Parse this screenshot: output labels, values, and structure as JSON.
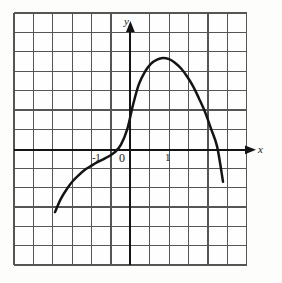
{
  "figure": {
    "name": "graph-of-function-on-grid",
    "background_color": "#fdfdfc",
    "grid_color": "#5a5a5a",
    "axis_color": "#1a1a1a",
    "curve_color": "#141414"
  },
  "labels": {
    "y_axis": "y",
    "x_axis": "x",
    "tick_neg_one": "-1",
    "tick_zero": "0",
    "tick_one": "1"
  },
  "chart_data": {
    "type": "line",
    "title": "",
    "xlabel": "x",
    "ylabel": "y",
    "grid": true,
    "grid_columns": 12,
    "grid_rows": 13,
    "grid_cell_px": 19.4,
    "legend": null,
    "axes": {
      "origin_px": [
        133,
        150
      ],
      "unit_px": 38.8,
      "xlim": [
        -3.07,
        2.94
      ],
      "ylim": [
        -2.89,
        3.53
      ],
      "x_ticks": [
        -1,
        0,
        1
      ],
      "y_ticks": []
    },
    "x": [
      -2.01,
      -1.86,
      -1.7,
      -1.55,
      -1.39,
      -1.24,
      -1.08,
      -0.93,
      -0.77,
      -0.62,
      -0.46,
      -0.31,
      -0.15,
      0.0,
      0.15,
      0.31,
      0.46,
      0.62,
      0.77,
      0.93,
      1.08,
      1.24,
      1.39,
      1.55,
      1.7,
      1.86,
      2.01,
      2.17,
      2.32
    ],
    "y": [
      -1.6,
      -1.26,
      -1.0,
      -0.8,
      -0.64,
      -0.51,
      -0.41,
      -0.32,
      -0.24,
      -0.16,
      -0.05,
      0.14,
      0.53,
      1.16,
      1.69,
      2.02,
      2.22,
      2.33,
      2.37,
      2.34,
      2.25,
      2.1,
      1.9,
      1.64,
      1.33,
      0.97,
      0.55,
      0.08,
      -0.82
    ],
    "annotations": [
      {
        "name": "left-endpoint",
        "x": -2.01,
        "y": -1.6
      },
      {
        "name": "inflection-plateau",
        "x": -1.0,
        "y": -0.13
      },
      {
        "name": "y-intercept",
        "x": 0.0,
        "y": 1.16
      },
      {
        "name": "maximum",
        "x": 0.82,
        "y": 2.37
      },
      {
        "name": "right-endpoint",
        "x": 2.32,
        "y": -0.82
      }
    ]
  }
}
